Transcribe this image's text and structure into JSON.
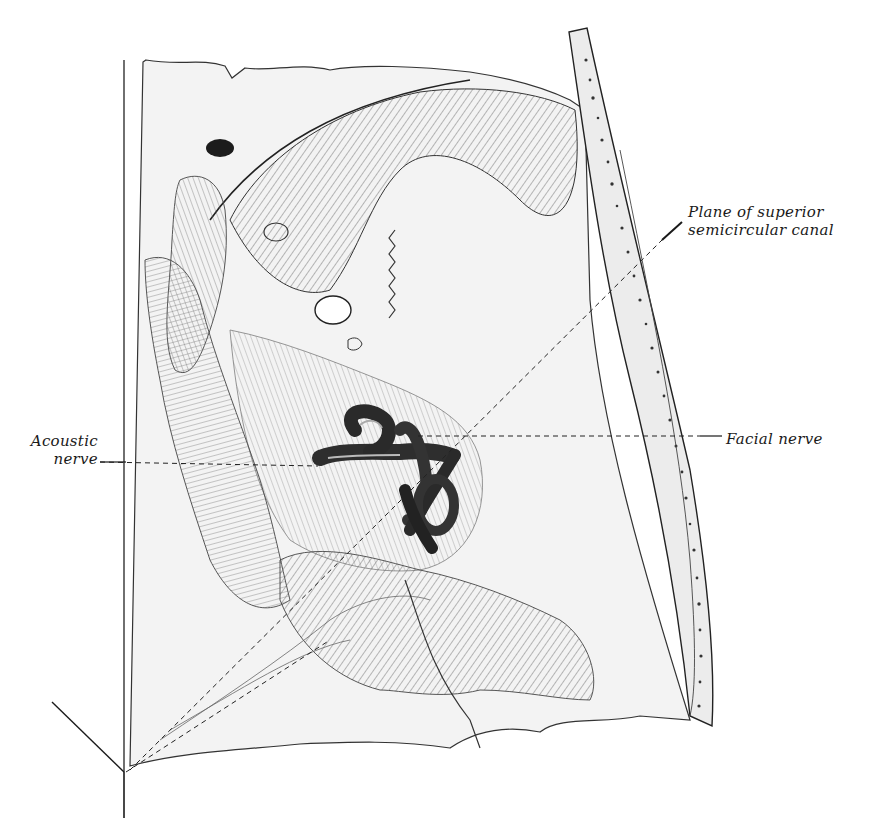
{
  "figure": {
    "style": "engraved line illustration",
    "colors": {
      "ink": "#1a1a1a",
      "bone_fill": "#f1f1f1",
      "labyrinth": "#3a3a3a",
      "background": "#ffffff"
    }
  },
  "labels": {
    "plane": {
      "line1": "Plane of superior",
      "line2": "semicircular canal"
    },
    "acoustic": {
      "line1": "Acoustic",
      "line2": "nerve"
    },
    "facial": {
      "line1": "Facial nerve"
    }
  }
}
